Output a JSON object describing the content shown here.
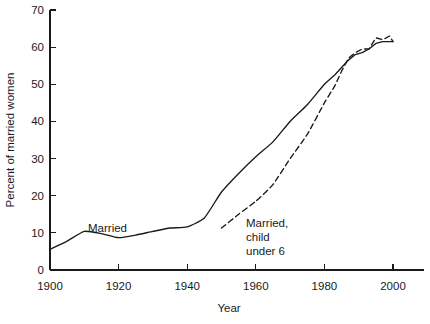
{
  "chart_data": {
    "type": "line",
    "title": "",
    "xlabel": "Year",
    "ylabel": "Percent of married women",
    "xlim": [
      1900,
      2002
    ],
    "ylim": [
      0,
      70
    ],
    "xticks": [
      1900,
      1920,
      1940,
      1960,
      1980,
      2000
    ],
    "xtick_labels": [
      "1900",
      "1920",
      "1940",
      "1960",
      "1980",
      "2000"
    ],
    "yticks": [
      0,
      10,
      20,
      30,
      40,
      50,
      60,
      70
    ],
    "ytick_labels": [
      "0",
      "10",
      "20",
      "30",
      "40",
      "50",
      "60",
      "70"
    ],
    "grid": false,
    "legend_position": "inline-annotations",
    "spines": [
      "left",
      "bottom"
    ],
    "series": [
      {
        "name": "Married",
        "style": "solid",
        "color": "#1a1a1a",
        "label_text": "Married",
        "x": [
          1900,
          1905,
          1910,
          1915,
          1920,
          1925,
          1930,
          1935,
          1940,
          1945,
          1950,
          1955,
          1960,
          1965,
          1970,
          1975,
          1980,
          1983,
          1985,
          1987,
          1989,
          1991,
          1993,
          1995,
          1997,
          1999,
          2000
        ],
        "values": [
          5.6,
          7.8,
          10.4,
          9.8,
          8.7,
          9.4,
          10.4,
          11.3,
          11.6,
          14.0,
          21.0,
          26.0,
          30.5,
          34.5,
          40.0,
          44.5,
          50.0,
          52.5,
          54.5,
          56.5,
          58.0,
          58.5,
          59.5,
          61.0,
          61.5,
          61.5,
          61.5
        ]
      },
      {
        "name": "Married, child under 6",
        "style": "dashed",
        "color": "#1a1a1a",
        "label_text": "Married,\nchild\nunder 6",
        "label_lines": [
          "Married,",
          "child",
          "under 6"
        ],
        "x": [
          1950,
          1955,
          1960,
          1965,
          1970,
          1975,
          1980,
          1983,
          1985,
          1987,
          1989,
          1991,
          1993,
          1995,
          1997,
          1999,
          2000
        ],
        "values": [
          11.3,
          15.0,
          18.5,
          23.0,
          30.0,
          36.5,
          45.0,
          49.5,
          53.5,
          57.0,
          58.5,
          59.5,
          59.5,
          62.5,
          62.0,
          63.0,
          61.5
        ]
      }
    ],
    "annotations": [
      {
        "text": "Married",
        "x": 1913,
        "y": 14.5
      },
      {
        "text": "Married, child under 6",
        "x": 1958,
        "y": 13.0
      }
    ]
  }
}
